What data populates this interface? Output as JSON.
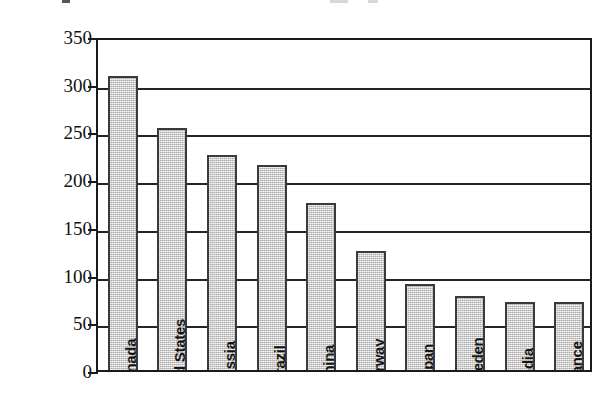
{
  "chart_data": {
    "type": "bar",
    "title": "",
    "xlabel": "",
    "ylabel": "Billion Kilowatt-hours",
    "ylim": [
      0,
      350
    ],
    "ytick_step": 50,
    "yticks": [
      0,
      50,
      100,
      150,
      200,
      250,
      300,
      350
    ],
    "ytick_labels": [
      "0",
      "50",
      "100",
      "150",
      "200",
      "250",
      "300",
      "350"
    ],
    "grid": "horizontal",
    "legend": "none",
    "bar_fill_color": "#c9c9c9",
    "bar_edge_color": "#3a3a3a",
    "axis_color": "#1a1a1a",
    "categories": [
      "Canada",
      "United States",
      "Russia",
      "Brazil",
      "China",
      "Norway",
      "Japan",
      "Sweden",
      "India",
      "France"
    ],
    "values": [
      308,
      254,
      225,
      215,
      175,
      125,
      90,
      78,
      71,
      71
    ],
    "labels_inside_bars": true,
    "label_rotation_degrees": 90
  }
}
